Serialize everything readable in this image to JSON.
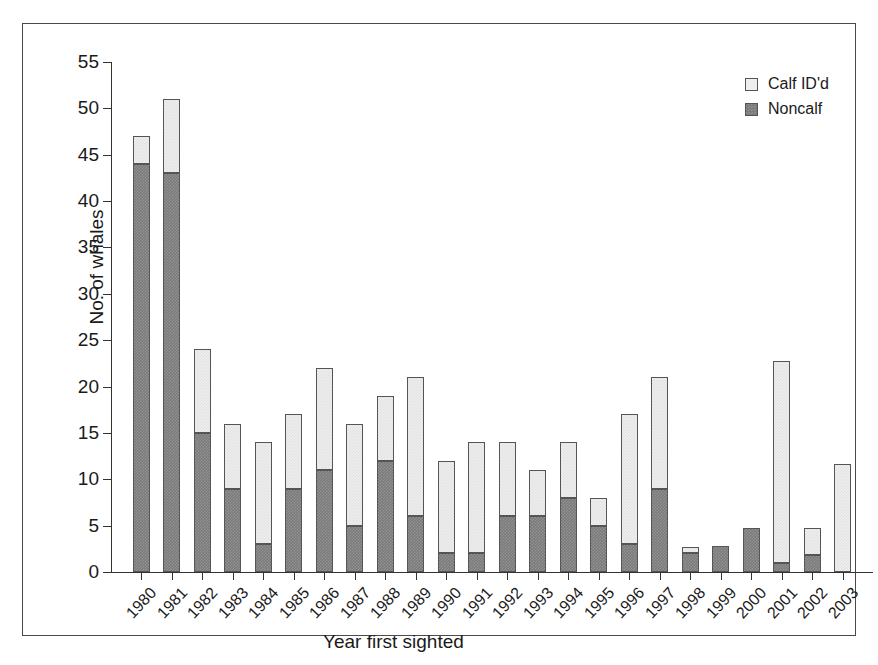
{
  "chart_data": {
    "type": "bar",
    "subtype": "stacked",
    "title": "",
    "xlabel": "Year first sighted",
    "ylabel": "No. of whales",
    "ylim": [
      0,
      55
    ],
    "ytick_step": 5,
    "yticks": [
      0,
      5,
      10,
      15,
      20,
      25,
      30,
      35,
      40,
      45,
      50,
      55
    ],
    "grid": false,
    "legend_position": "top-right",
    "categories": [
      "1980",
      "1981",
      "1982",
      "1983",
      "1984",
      "1985",
      "1986",
      "1987",
      "1988",
      "1989",
      "1990",
      "1991",
      "1992",
      "1993",
      "1994",
      "1995",
      "1996",
      "1997",
      "1998",
      "1999",
      "2000",
      "2001",
      "2002",
      "2003"
    ],
    "series": [
      {
        "name": "Noncalf",
        "color": "#7b7b7b",
        "values": [
          44,
          43,
          15,
          9,
          3,
          9,
          11,
          5,
          12,
          6,
          2,
          2,
          6,
          6,
          8,
          5,
          3,
          9,
          2,
          2.8,
          4.8,
          1,
          1.8,
          0
        ]
      },
      {
        "name": "Calf ID'd",
        "color": "#eeeeee",
        "values": [
          3,
          8,
          9,
          7,
          11,
          8,
          11,
          11,
          7,
          15,
          10,
          12,
          8,
          5,
          6,
          3,
          14,
          12,
          0.7,
          0,
          0,
          21.8,
          3,
          11.7
        ]
      }
    ],
    "totals": [
      47,
      51,
      24,
      16,
      14,
      17,
      22,
      16,
      19,
      21,
      12,
      14,
      14,
      11,
      14,
      8,
      17,
      21,
      2.7,
      2.8,
      4.8,
      22.8,
      4.8,
      11.7
    ]
  },
  "legend": {
    "entries": [
      {
        "label": "Calf ID'd",
        "swatch": "calf"
      },
      {
        "label": "Noncalf",
        "swatch": "noncalf"
      }
    ]
  },
  "colors": {
    "noncalf": "#7b7b7b",
    "calf": "#eeeeee",
    "axis": "#333333",
    "frame": "#4a4a4a",
    "text": "#1a1a1a"
  }
}
